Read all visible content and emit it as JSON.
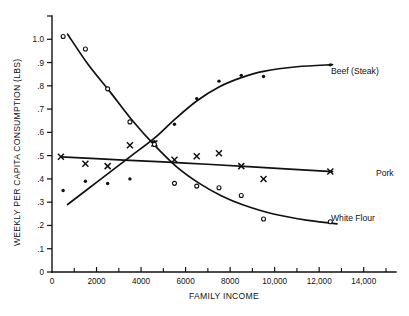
{
  "chart_data": {
    "type": "line",
    "title": "",
    "xlabel": "FAMILY INCOME",
    "ylabel": "WEEKLY PER CAPITA CONSUMPTION (LBS)",
    "xlim": [
      0,
      16000
    ],
    "ylim": [
      0,
      1.1
    ],
    "grid": false,
    "legend_position": "right-of-curve-ends",
    "x_ticks": [
      0,
      2000,
      4000,
      6000,
      8000,
      10000,
      12000,
      14000
    ],
    "x_tick_labels": [
      "0",
      "2000",
      "4000",
      "6000",
      "8000",
      "10,000",
      "12,000",
      "14,000"
    ],
    "x_minor_ticks": [
      1000,
      3000,
      5000,
      7000,
      9000,
      11000,
      13000,
      15000
    ],
    "y_ticks": [
      0,
      0.1,
      0.2,
      0.3,
      0.4,
      0.5,
      0.6,
      0.7,
      0.8,
      0.9,
      1.0,
      1.1
    ],
    "y_tick_labels": [
      "0",
      ".1",
      ".2",
      ".3",
      ".4",
      ".5",
      ".6",
      ".7",
      ".8",
      ".9",
      "1.0",
      ""
    ],
    "series": [
      {
        "name": "Beef (Steak)",
        "label": "Beef (Steak)",
        "marker": "filled-circle",
        "points": [
          {
            "x": 500,
            "y": 0.35
          },
          {
            "x": 1500,
            "y": 0.39
          },
          {
            "x": 2500,
            "y": 0.38
          },
          {
            "x": 3500,
            "y": 0.4
          },
          {
            "x": 4600,
            "y": 0.56
          },
          {
            "x": 5500,
            "y": 0.635
          },
          {
            "x": 6500,
            "y": 0.745
          },
          {
            "x": 7500,
            "y": 0.82
          },
          {
            "x": 8500,
            "y": 0.845
          },
          {
            "x": 9500,
            "y": 0.84
          },
          {
            "x": 12500,
            "y": 0.89
          }
        ],
        "curve": [
          {
            "x": 700,
            "y": 0.29
          },
          {
            "x": 2000,
            "y": 0.385
          },
          {
            "x": 3500,
            "y": 0.495
          },
          {
            "x": 4600,
            "y": 0.575
          },
          {
            "x": 5500,
            "y": 0.655
          },
          {
            "x": 6500,
            "y": 0.735
          },
          {
            "x": 7500,
            "y": 0.795
          },
          {
            "x": 8500,
            "y": 0.835
          },
          {
            "x": 9500,
            "y": 0.862
          },
          {
            "x": 11000,
            "y": 0.882
          },
          {
            "x": 12600,
            "y": 0.891
          }
        ]
      },
      {
        "name": "Pork",
        "label": "Pork",
        "marker": "x",
        "points": [
          {
            "x": 400,
            "y": 0.495
          },
          {
            "x": 1500,
            "y": 0.465
          },
          {
            "x": 2500,
            "y": 0.455
          },
          {
            "x": 3500,
            "y": 0.545
          },
          {
            "x": 4600,
            "y": 0.552
          },
          {
            "x": 5500,
            "y": 0.482
          },
          {
            "x": 6500,
            "y": 0.497
          },
          {
            "x": 7500,
            "y": 0.51
          },
          {
            "x": 8500,
            "y": 0.455
          },
          {
            "x": 9500,
            "y": 0.4
          },
          {
            "x": 12500,
            "y": 0.432
          }
        ],
        "curve": [
          {
            "x": 400,
            "y": 0.495
          },
          {
            "x": 3000,
            "y": 0.482
          },
          {
            "x": 6000,
            "y": 0.468
          },
          {
            "x": 9000,
            "y": 0.452
          },
          {
            "x": 12600,
            "y": 0.431
          }
        ]
      },
      {
        "name": "White Flour",
        "label": "White Flour",
        "marker": "open-circle",
        "points": [
          {
            "x": 500,
            "y": 1.012
          },
          {
            "x": 1500,
            "y": 0.958
          },
          {
            "x": 2500,
            "y": 0.787
          },
          {
            "x": 3500,
            "y": 0.645
          },
          {
            "x": 4600,
            "y": 0.548
          },
          {
            "x": 5500,
            "y": 0.381
          },
          {
            "x": 6500,
            "y": 0.369
          },
          {
            "x": 7500,
            "y": 0.362
          },
          {
            "x": 8500,
            "y": 0.329
          },
          {
            "x": 9500,
            "y": 0.228
          },
          {
            "x": 12500,
            "y": 0.216
          }
        ],
        "curve": [
          {
            "x": 700,
            "y": 1.022
          },
          {
            "x": 1600,
            "y": 0.895
          },
          {
            "x": 2600,
            "y": 0.775
          },
          {
            "x": 3600,
            "y": 0.652
          },
          {
            "x": 4600,
            "y": 0.545
          },
          {
            "x": 5600,
            "y": 0.452
          },
          {
            "x": 6600,
            "y": 0.382
          },
          {
            "x": 7600,
            "y": 0.328
          },
          {
            "x": 8600,
            "y": 0.288
          },
          {
            "x": 10000,
            "y": 0.248
          },
          {
            "x": 11500,
            "y": 0.222
          },
          {
            "x": 12800,
            "y": 0.207
          }
        ]
      }
    ]
  },
  "labels": {
    "beef": "Beef (Steak)",
    "pork": "Pork",
    "white_flour": "White Flour",
    "x_axis_title": "FAMILY INCOME",
    "y_axis_title": "WEEKLY PER CAPITA CONSUMPTION (LBS)"
  },
  "colors": {
    "ink": "#111111",
    "paper": "#ffffff"
  }
}
